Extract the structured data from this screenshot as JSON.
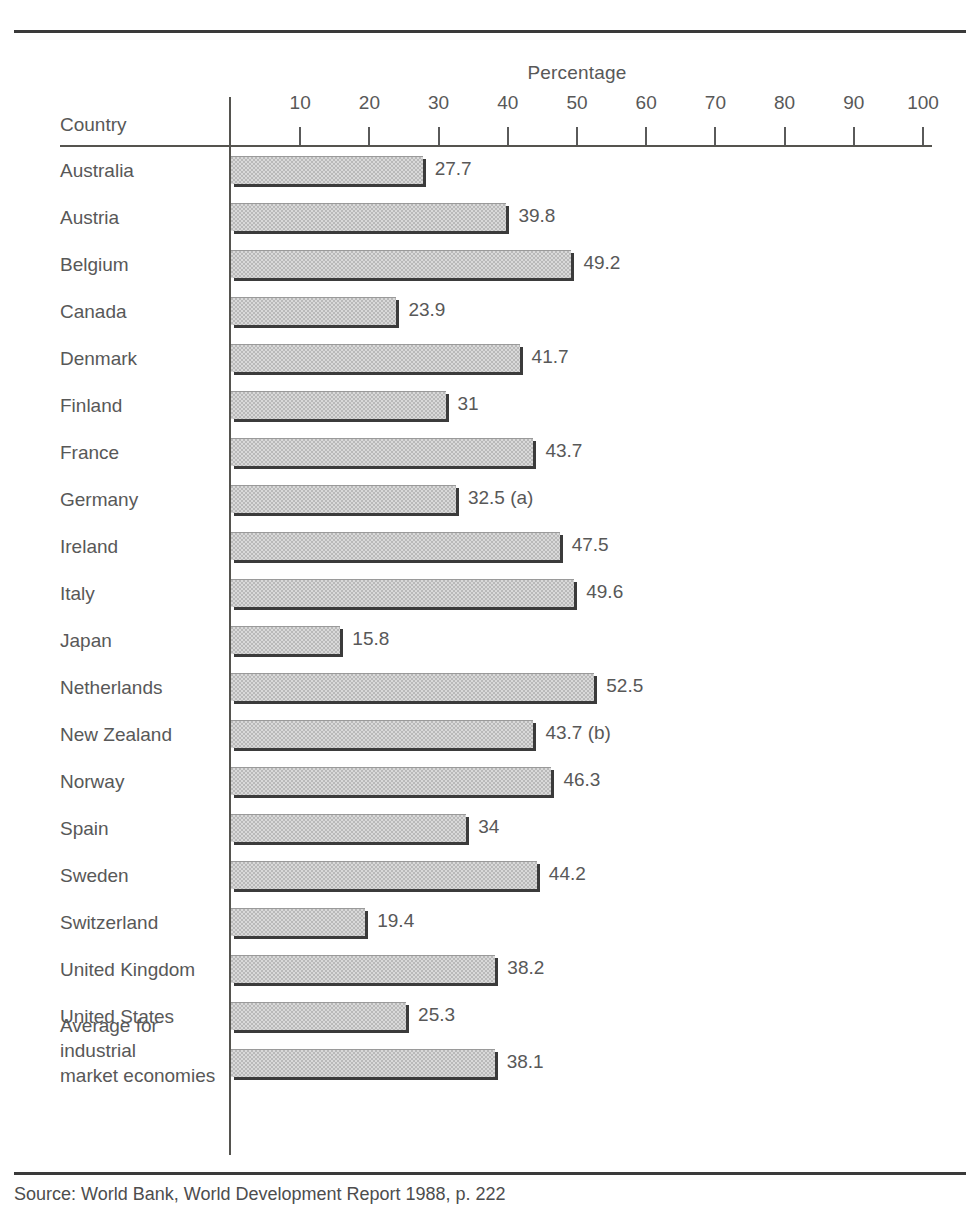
{
  "figure": {
    "axis_title": "Percentage",
    "corner_label": "Country",
    "source_note": "Source: World Bank, World Development Report 1988, p. 222"
  },
  "chart_data": {
    "type": "bar",
    "orientation": "horizontal",
    "title": "",
    "xlabel": "Percentage",
    "ylabel": "Country",
    "xlim": [
      0,
      100
    ],
    "grid": false,
    "legend": null,
    "tick_labels": [
      "10",
      "20",
      "30",
      "40",
      "50",
      "60",
      "70",
      "80",
      "90",
      "100"
    ],
    "ticks": [
      10,
      20,
      30,
      40,
      50,
      60,
      70,
      80,
      90,
      100
    ],
    "bar_color": "#b9b9b9",
    "shadow_color": "#3b3b3b",
    "text_color": "#585858",
    "categories": [
      "Australia",
      "Austria",
      "Belgium",
      "Canada",
      "Denmark",
      "Finland",
      "France",
      "Germany",
      "Ireland",
      "Italy",
      "Japan",
      "Netherlands",
      "New Zealand",
      "Norway",
      "Spain",
      "Sweden",
      "Switzerland",
      "United Kingdom",
      "United States",
      "Average for\nindustrial\nmarket economies"
    ],
    "values": [
      27.7,
      39.8,
      49.2,
      23.9,
      41.7,
      31,
      43.7,
      32.5,
      47.5,
      49.6,
      15.8,
      52.5,
      43.7,
      46.3,
      34,
      44.2,
      19.4,
      38.2,
      25.3,
      38.1
    ],
    "value_labels": [
      "27.7",
      "39.8",
      "49.2",
      "23.9",
      "41.7",
      "31",
      "43.7",
      "32.5  (a)",
      "47.5",
      "49.6",
      "15.8",
      "52.5",
      "43.7  (b)",
      "46.3",
      "34",
      "44.2",
      "19.4",
      "38.2",
      "25.3",
      "38.1"
    ],
    "footnote_markers": [
      "(a)",
      "(b)"
    ]
  }
}
